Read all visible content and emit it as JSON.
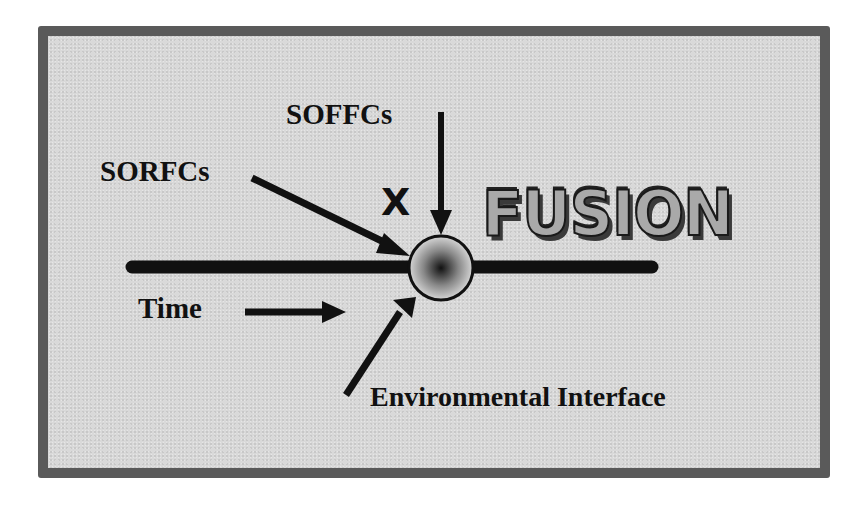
{
  "diagram": {
    "labels": {
      "soffcs": "SOFFCs",
      "sorfcs": "SORFCs",
      "x_mark": "X",
      "fusion": "FUSION",
      "time": "Time",
      "environmental_interface": "Environmental Interface"
    },
    "colors": {
      "frame_border": "#5a5a5a",
      "frame_fill": "#d9d9d9",
      "ink": "#111111"
    }
  }
}
